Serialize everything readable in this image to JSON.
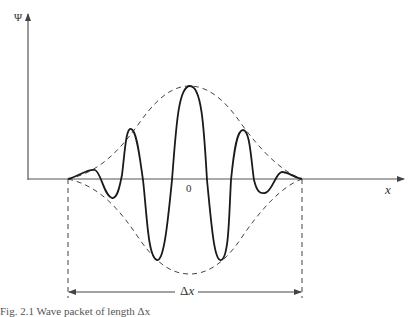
{
  "figure": {
    "y_axis_label": "Ψ",
    "x_axis_label": "x",
    "origin_label": "0",
    "width_label": "Δx",
    "width_label_symbol": "Δ",
    "width_label_var": "x",
    "caption": "Fig. 2.1  Wave packet of length Δx"
  },
  "colors": {
    "curve": "#1a1a1a",
    "axis": "#555555",
    "envelope": "#444444",
    "background": "#ffffff"
  }
}
